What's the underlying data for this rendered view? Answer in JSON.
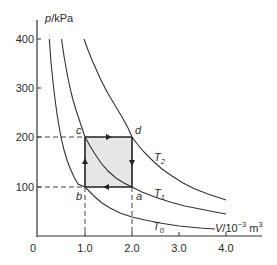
{
  "diagram": {
    "type": "pV cycle diagram",
    "y_axis": {
      "label_var": "p",
      "label_unit": "/kPa",
      "ticks": [
        "400",
        "300",
        "200",
        "100"
      ]
    },
    "x_axis": {
      "label_var": "V",
      "label_unit": "/10",
      "label_exp": "−3",
      "label_unit2": " m",
      "label_unit2_exp": "3",
      "ticks": [
        "1.0",
        "2.0",
        "3.0",
        "4.0"
      ],
      "origin": "0"
    },
    "points": {
      "a": "a",
      "b": "b",
      "c": "c",
      "d": "d"
    },
    "isotherms": [
      {
        "name": "T",
        "sub": "0",
        "pV": 100
      },
      {
        "name": "T",
        "sub": "1",
        "pV": 200
      },
      {
        "name": "T",
        "sub": "2",
        "pV": 400
      }
    ],
    "cycle": {
      "vertices": {
        "a": [
          2.0,
          100
        ],
        "b": [
          1.0,
          100
        ],
        "c": [
          1.0,
          200
        ],
        "d": [
          2.0,
          200
        ]
      },
      "direction": [
        "a→b",
        "b→c",
        "c→d",
        "d→a"
      ],
      "fill": "#e6e6e6",
      "line_color": "#222222"
    }
  }
}
